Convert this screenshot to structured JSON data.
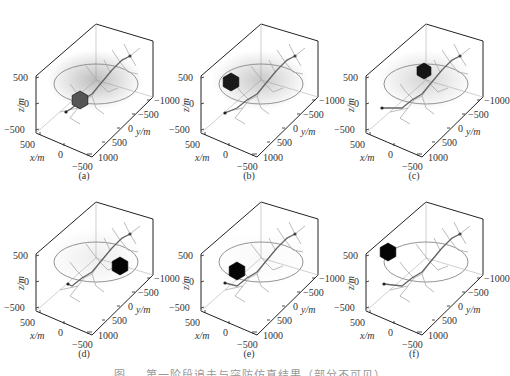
{
  "figure": {
    "caption": "图 … 第一阶段追击与突防仿真结果（部分不可见）",
    "panels": [
      {
        "id": "a",
        "label": "(a)",
        "left": 0,
        "top": 0,
        "cube": {
          "x": 80,
          "y": 100,
          "size": 18,
          "shade": "#555555"
        },
        "haze": 0.55,
        "dot": {
          "x": 66,
          "y": 112
        }
      },
      {
        "id": "b",
        "label": "(b)",
        "left": 165,
        "top": 0,
        "cube": {
          "x": 66,
          "y": 82,
          "size": 18,
          "shade": "#1a1a1a"
        },
        "haze": 0.45,
        "dot": {
          "x": 60,
          "y": 113
        }
      },
      {
        "id": "c",
        "label": "(c)",
        "left": 330,
        "top": 0,
        "cube": {
          "x": 94,
          "y": 71,
          "size": 16,
          "shade": "#151515"
        },
        "haze": 0.35,
        "dot": {
          "x": 52,
          "y": 108
        }
      },
      {
        "id": "d",
        "label": "(d)",
        "left": 0,
        "top": 178,
        "cube": {
          "x": 120,
          "y": 88,
          "size": 18,
          "shade": "#050505"
        },
        "haze": 0.15,
        "dot": {
          "x": 68,
          "y": 106
        }
      },
      {
        "id": "e",
        "label": "(e)",
        "left": 165,
        "top": 178,
        "cube": {
          "x": 72,
          "y": 93,
          "size": 18,
          "shade": "#050505"
        },
        "haze": 0.05,
        "dot": {
          "x": 60,
          "y": 105
        }
      },
      {
        "id": "f",
        "label": "(f)",
        "left": 330,
        "top": 178,
        "cube": {
          "x": 58,
          "y": 74,
          "size": 18,
          "shade": "#050505"
        },
        "haze": 0.0,
        "dot": {
          "x": 54,
          "y": 106
        }
      }
    ],
    "axes": {
      "z_label": "z/m",
      "y_label": "y/m",
      "x_label": "x/m",
      "z_ticks": [
        "500",
        "0",
        "−500"
      ],
      "y_ticks": [
        "−1000",
        "−500",
        "0",
        "500",
        "1000"
      ],
      "x_ticks": [
        "500",
        "0",
        "−500"
      ]
    }
  },
  "chart_data": {
    "type": "scatter",
    "xlabel": "x/m",
    "ylabel": "y/m",
    "zlabel": "z/m",
    "xlim": [
      -500,
      500
    ],
    "ylim": [
      -1000,
      1000
    ],
    "zlim": [
      -500,
      500
    ],
    "x_ticks": [
      500,
      0,
      -500
    ],
    "y_ticks": [
      -1000,
      -500,
      0,
      500,
      1000
    ],
    "z_ticks": [
      500,
      0,
      -500
    ],
    "panels": [
      "(a)",
      "(b)",
      "(c)",
      "(d)",
      "(e)",
      "(f)"
    ],
    "series": [
      {
        "name": "target cube position (approx.)",
        "values": [
          {
            "panel": "(a)",
            "x": 300,
            "y": 0,
            "z": 0
          },
          {
            "panel": "(b)",
            "x": 300,
            "y": -300,
            "z": 400
          },
          {
            "panel": "(c)",
            "x": -200,
            "y": -500,
            "z": 400
          },
          {
            "panel": "(d)",
            "x": -400,
            "y": 500,
            "z": 0
          },
          {
            "panel": "(e)",
            "x": 300,
            "y": 300,
            "z": 0
          },
          {
            "panel": "(f)",
            "x": 400,
            "y": -300,
            "z": 400
          }
        ]
      },
      {
        "name": "start point",
        "values": [
          {
            "x": 400,
            "y": 500,
            "z": -300
          }
        ]
      },
      {
        "name": "circular guard ring",
        "values": [
          {
            "center_z": 0,
            "radius_m": 500
          }
        ]
      }
    ],
    "grid": false,
    "legend": "none"
  }
}
